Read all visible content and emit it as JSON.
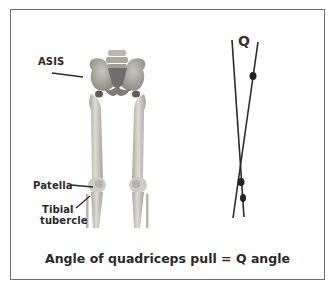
{
  "figure": {
    "labels": {
      "asis": "ASIS",
      "patella": "Patella",
      "tibial_tubercle_line1": "Tibial",
      "tibial_tubercle_line2": "tubercle",
      "q": "Q"
    },
    "caption": "Angle of quadriceps pull = Q angle",
    "colors": {
      "frame_border": "#6e6e6e",
      "bone": "#cfcfc6",
      "bone_shadow": "#9c9c95",
      "line": "#2b2b2b",
      "text": "#2a2a2a"
    }
  }
}
